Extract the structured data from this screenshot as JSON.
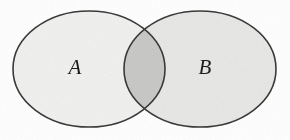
{
  "figure": {
    "type": "venn-diagram",
    "title": "",
    "width": 290,
    "height": 140,
    "background_color": "#ffffff",
    "stroke_color": "#3a3a3a",
    "stroke_width": 1.6
  },
  "sets": [
    {
      "id": "A",
      "label": "A",
      "label_x": 75,
      "label_y": 69,
      "center_x": 89,
      "center_y": 69,
      "radius_x": 76,
      "radius_y": 58,
      "fill_color": "#f1f1f0"
    },
    {
      "id": "B",
      "label": "B",
      "label_x": 205,
      "label_y": 69,
      "center_x": 200,
      "center_y": 69,
      "radius_x": 76,
      "radius_y": 58,
      "fill_color": "#e8e8e7"
    }
  ],
  "intersection": {
    "label": "",
    "fill_color": "#c9c9c8",
    "left_x": 124,
    "right_x": 165,
    "top_y": 30,
    "bottom_y": 108
  }
}
